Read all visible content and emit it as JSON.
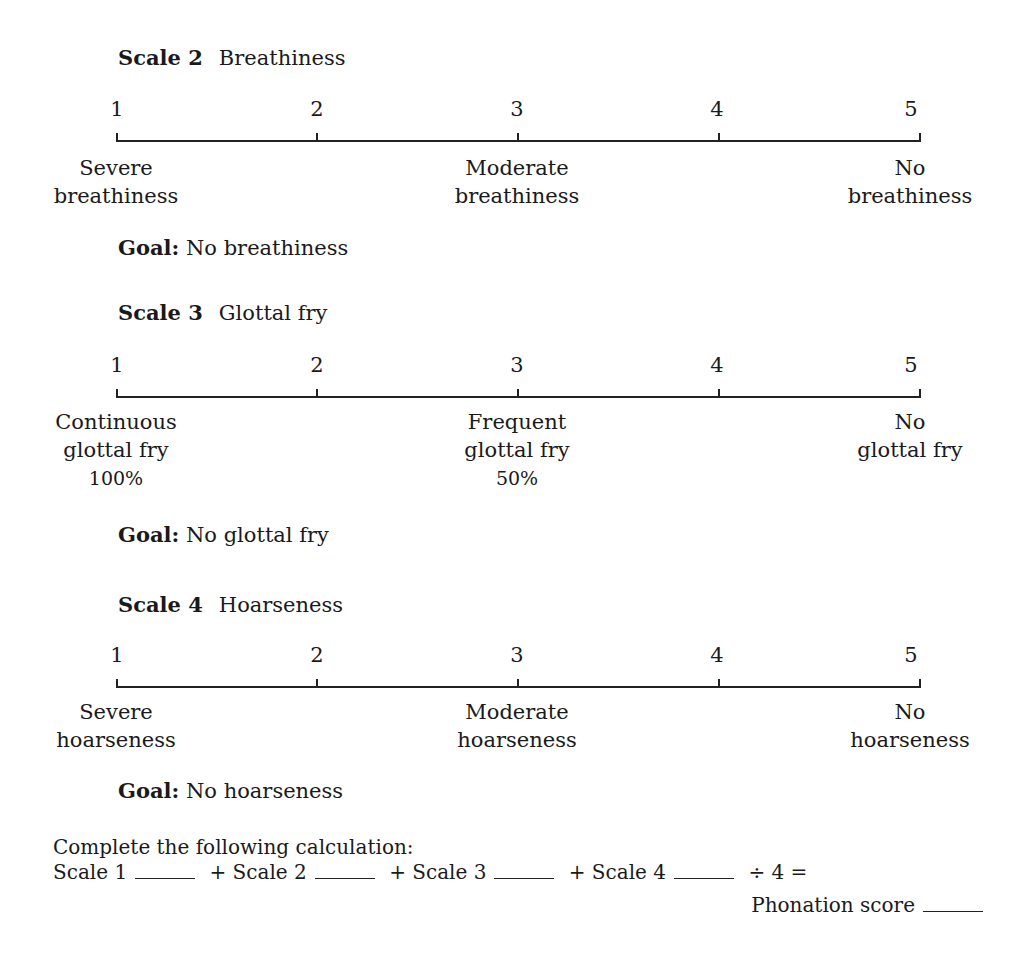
{
  "scales": [
    {
      "id": "scale-2",
      "label": "Scale 2",
      "name": "Breathiness",
      "points": [
        "1",
        "2",
        "3",
        "4",
        "5"
      ],
      "anchors": {
        "left": [
          "Severe",
          "breathiness"
        ],
        "middle": [
          "Moderate",
          "breathiness"
        ],
        "right": [
          "No",
          "breathiness"
        ]
      },
      "goal_label": "Goal:",
      "goal_text": "No breathiness"
    },
    {
      "id": "scale-3",
      "label": "Scale 3",
      "name": "Glottal fry",
      "points": [
        "1",
        "2",
        "3",
        "4",
        "5"
      ],
      "anchors": {
        "left": [
          "Continuous",
          "glottal fry",
          "100%"
        ],
        "middle": [
          "Frequent",
          "glottal fry",
          "50%"
        ],
        "right": [
          "No",
          "glottal fry"
        ]
      },
      "goal_label": "Goal:",
      "goal_text": "No glottal fry"
    },
    {
      "id": "scale-4",
      "label": "Scale 4",
      "name": "Hoarseness",
      "points": [
        "1",
        "2",
        "3",
        "4",
        "5"
      ],
      "anchors": {
        "left": [
          "Severe",
          "hoarseness"
        ],
        "middle": [
          "Moderate",
          "hoarseness"
        ],
        "right": [
          "No",
          "hoarseness"
        ]
      },
      "goal_label": "Goal:",
      "goal_text": "No hoarseness"
    }
  ],
  "calculation": {
    "instruction": "Complete the following calculation:",
    "terms": [
      "Scale 1",
      "+ Scale 2",
      "+ Scale 3",
      "+ Scale 4"
    ],
    "operator": "÷ 4 =",
    "result_label": "Phonation score"
  }
}
